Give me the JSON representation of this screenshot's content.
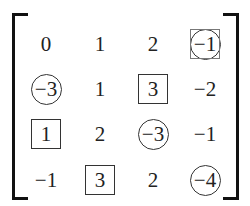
{
  "matrix": {
    "rows": [
      [
        {
          "value": "0",
          "mark": "none"
        },
        {
          "value": "1",
          "mark": "none"
        },
        {
          "value": "2",
          "mark": "none"
        },
        {
          "value": "−1",
          "mark": "circle-in-square"
        }
      ],
      [
        {
          "value": "−3",
          "mark": "circle"
        },
        {
          "value": "1",
          "mark": "none"
        },
        {
          "value": "3",
          "mark": "square"
        },
        {
          "value": "−2",
          "mark": "none"
        }
      ],
      [
        {
          "value": "1",
          "mark": "square"
        },
        {
          "value": "2",
          "mark": "none"
        },
        {
          "value": "−3",
          "mark": "circle"
        },
        {
          "value": "−1",
          "mark": "none"
        }
      ],
      [
        {
          "value": "−1",
          "mark": "none"
        },
        {
          "value": "3",
          "mark": "square"
        },
        {
          "value": "2",
          "mark": "none"
        },
        {
          "value": "−4",
          "mark": "circle"
        }
      ]
    ]
  }
}
